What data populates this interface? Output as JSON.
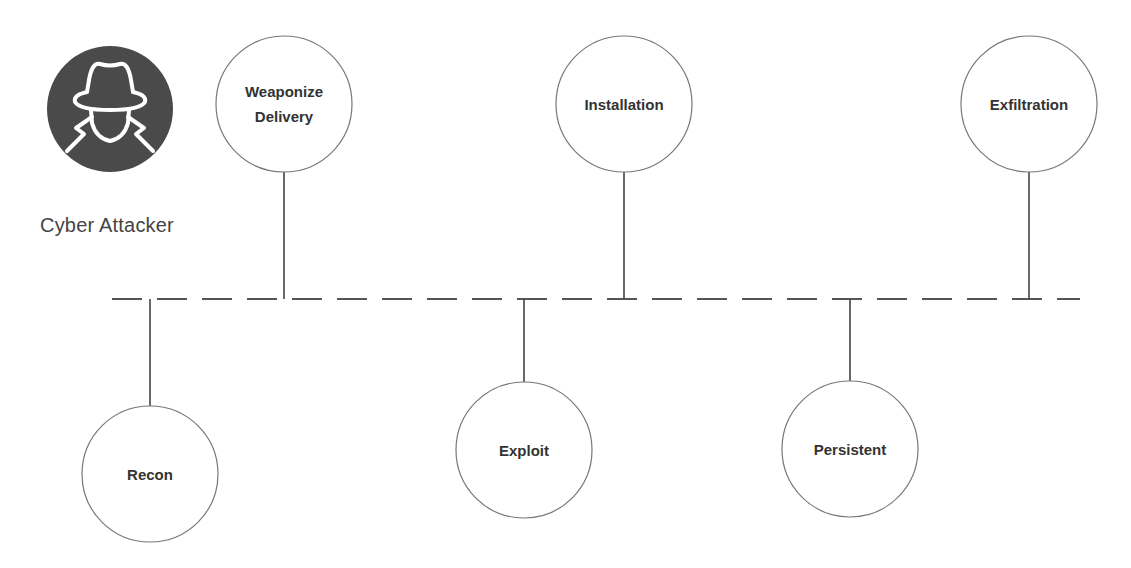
{
  "actor": {
    "label": "Cyber Attacker",
    "icon": "hacker-spy-icon",
    "icon_fill": "#4a4a4a",
    "icon_stroke": "#ffffff"
  },
  "timeline": {
    "y": 299,
    "x_start": 112,
    "x_end": 1080,
    "dash": "30 15",
    "color": "#555555"
  },
  "stages": [
    {
      "id": "recon",
      "lines": [
        "Recon"
      ],
      "position": "below",
      "cx": 150,
      "cy": 474
    },
    {
      "id": "weaponize-delivery",
      "lines": [
        "Weaponize",
        "Delivery"
      ],
      "position": "above",
      "cx": 284,
      "cy": 104
    },
    {
      "id": "exploit",
      "lines": [
        "Exploit"
      ],
      "position": "below",
      "cx": 524,
      "cy": 450
    },
    {
      "id": "installation",
      "lines": [
        "Installation"
      ],
      "position": "above",
      "cx": 624,
      "cy": 104
    },
    {
      "id": "persistent",
      "lines": [
        "Persistent"
      ],
      "position": "below",
      "cx": 850,
      "cy": 449
    },
    {
      "id": "exfiltration",
      "lines": [
        "Exfiltration"
      ],
      "position": "above",
      "cx": 1029,
      "cy": 104
    }
  ],
  "style": {
    "node_radius": 68,
    "node_stroke": "#777777",
    "connector_color": "#444444",
    "text_color": "#333333"
  }
}
